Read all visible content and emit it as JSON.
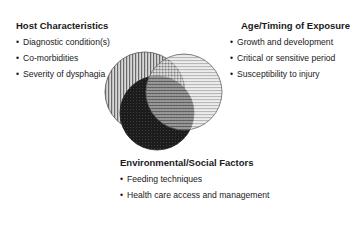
{
  "diagram": {
    "type": "venn",
    "circles": [
      {
        "id": "host",
        "pattern": "vertical-stripes",
        "color": "#8c8c8c",
        "cx": 145,
        "cy": 92,
        "r": 40
      },
      {
        "id": "age",
        "pattern": "horizontal-stripes",
        "color": "#a8a8a8",
        "cx": 184,
        "cy": 92,
        "r": 38
      },
      {
        "id": "env",
        "pattern": "dark-dots",
        "color": "#1e1e1e",
        "cx": 157,
        "cy": 113,
        "r": 37
      }
    ]
  },
  "host": {
    "heading": "Host Characteristics",
    "items": [
      "Diagnostic condition(s)",
      "Co-morbidities",
      "Severity of dysphagia"
    ]
  },
  "age": {
    "heading": "Age/Timing of Exposure",
    "items": [
      "Growth and development",
      "Critical or sensitive period",
      "Susceptibility to injury"
    ]
  },
  "env": {
    "heading": "Environmental/Social Factors",
    "items": [
      "Feeding techniques",
      "Health care access and management"
    ]
  },
  "bullet": "•"
}
